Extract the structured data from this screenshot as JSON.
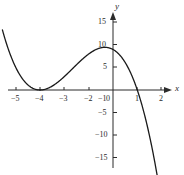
{
  "figure": {
    "background_color": "#ffffff",
    "curve_color": "#1a1a1a",
    "axis_color": "#2b2b2b",
    "text_color": "#2b2b2b",
    "x_axis_name": "x",
    "y_axis_name": "y"
  },
  "chart_data": {
    "type": "line",
    "title": "",
    "xlabel": "x",
    "ylabel": "y",
    "xlim": [
      -5.5,
      2.5
    ],
    "ylim": [
      -17,
      17
    ],
    "grid": false,
    "legend": "none",
    "x_ticks": [
      -5,
      -4,
      -3,
      -2,
      -1,
      0,
      1,
      2
    ],
    "x_tick_labels": [
      "−5",
      "−4",
      "−3",
      "−2",
      "−1",
      "0",
      "1",
      "2"
    ],
    "y_ticks": [
      -15,
      -10,
      -5,
      5,
      10,
      15
    ],
    "y_tick_labels": [
      "−15",
      "−10",
      "−5",
      "5",
      "10",
      "15"
    ],
    "origin_label": "0",
    "equation": "y = -(x + 3)^2 (x - 1)",
    "roots": [
      -3,
      1
    ],
    "local_minimum": {
      "x": -3,
      "y": 0
    },
    "local_maximum": {
      "x": -0.33,
      "y": 9.48
    },
    "y_intercept": 9,
    "domain_drawn": [
      -4.55,
      2.05
    ],
    "series": [
      {
        "name": "cubic",
        "x": [
          -4.55,
          -4.4,
          -4.2,
          -4.0,
          -3.8,
          -3.6,
          -3.4,
          -3.2,
          -3.0,
          -2.8,
          -2.6,
          -2.4,
          -2.2,
          -2.0,
          -1.8,
          -1.6,
          -1.4,
          -1.2,
          -1.0,
          -0.8,
          -0.6,
          -0.4,
          -0.2,
          0.0,
          0.2,
          0.4,
          0.6,
          0.8,
          1.0,
          1.2,
          1.4,
          1.6,
          1.8,
          2.05
        ],
        "y": [
          13.95,
          11.55,
          8.57,
          6.0,
          3.84,
          2.1,
          0.79,
          0.18,
          0.0,
          1.06,
          2.02,
          2.92,
          3.71,
          4.4,
          5.03,
          5.64,
          6.04,
          6.43,
          6.88,
          7.19,
          7.44,
          7.53,
          7.55,
          7.38,
          7.04,
          6.56,
          5.74,
          4.6,
          3.0,
          0.82,
          -2.0,
          -5.6,
          -10.0,
          -14.6
        ]
      }
    ]
  },
  "axes_geometry": {
    "origin_px": {
      "x": 113,
      "y": 90
    },
    "px_per_x_unit": 24.3,
    "px_per_y_unit": 4.5
  }
}
